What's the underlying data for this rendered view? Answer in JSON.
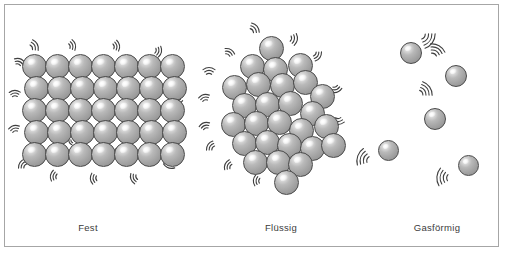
{
  "figure": {
    "width": 507,
    "height": 255,
    "background_color": "#ffffff",
    "frame_color": "#a6a6a6",
    "sphere_fill_color": "#a8a8a8",
    "sphere_outline_color": "#4a4a4a",
    "sphere_highlight_color": "#ffffff",
    "motion_line_color": "#3f3f3f",
    "caption_color": "#3b3b3b"
  },
  "panels": [
    {
      "id": "solid",
      "caption": "Fest",
      "caption_x": 88,
      "caption_y": 222,
      "arrangement": "regular-lattice",
      "rows": 5,
      "columns": 7,
      "particle_count": 35,
      "sphere_diameter": 25,
      "origin_x": 22,
      "origin_y": 54,
      "step_x": 23,
      "step_y": 22,
      "row_offsets": [
        0,
        1.5,
        0,
        1.5,
        0
      ],
      "motion_marks": [
        {
          "x": 28,
          "y": 49,
          "rot": -28,
          "arcs": 3,
          "size": 13
        },
        {
          "x": 66,
          "y": 47,
          "rot": -15,
          "arcs": 3,
          "size": 12
        },
        {
          "x": 110,
          "y": 47,
          "rot": -10,
          "arcs": 3,
          "size": 12
        },
        {
          "x": 152,
          "y": 50,
          "rot": 12,
          "arcs": 3,
          "size": 12
        },
        {
          "x": 172,
          "y": 63,
          "rot": 60,
          "arcs": 3,
          "size": 12
        },
        {
          "x": 175,
          "y": 95,
          "rot": 72,
          "arcs": 3,
          "size": 12
        },
        {
          "x": 176,
          "y": 130,
          "rot": 85,
          "arcs": 3,
          "size": 13
        },
        {
          "x": 172,
          "y": 158,
          "rot": 110,
          "arcs": 3,
          "size": 13
        },
        {
          "x": 140,
          "y": 176,
          "rot": 160,
          "arcs": 3,
          "size": 12
        },
        {
          "x": 100,
          "y": 178,
          "rot": 175,
          "arcs": 3,
          "size": 12
        },
        {
          "x": 60,
          "y": 177,
          "rot": 190,
          "arcs": 3,
          "size": 12
        },
        {
          "x": 28,
          "y": 168,
          "rot": 215,
          "arcs": 3,
          "size": 12
        },
        {
          "x": 16,
          "y": 135,
          "rot": 255,
          "arcs": 3,
          "size": 12
        },
        {
          "x": 15,
          "y": 100,
          "rot": 268,
          "arcs": 3,
          "size": 12
        },
        {
          "x": 17,
          "y": 68,
          "rot": 290,
          "arcs": 3,
          "size": 12
        },
        {
          "x": 52,
          "y": 92,
          "rot": 40,
          "arcs": 2,
          "size": 9
        },
        {
          "x": 96,
          "y": 112,
          "rot": -40,
          "arcs": 2,
          "size": 9
        },
        {
          "x": 128,
          "y": 90,
          "rot": 20,
          "arcs": 2,
          "size": 9
        },
        {
          "x": 74,
          "y": 140,
          "rot": 150,
          "arcs": 2,
          "size": 9
        },
        {
          "x": 120,
          "y": 152,
          "rot": 195,
          "arcs": 2,
          "size": 9
        }
      ]
    },
    {
      "id": "liquid",
      "caption": "Flüssig",
      "caption_x": 281,
      "caption_y": 222,
      "arrangement": "close-packed-irregular-cluster",
      "particle_count": 27,
      "sphere_diameter": 25,
      "spheres": [
        {
          "x": 259,
          "y": 36
        },
        {
          "x": 288,
          "y": 53
        },
        {
          "x": 240,
          "y": 54
        },
        {
          "x": 263,
          "y": 57
        },
        {
          "x": 222,
          "y": 75
        },
        {
          "x": 246,
          "y": 72
        },
        {
          "x": 270,
          "y": 73
        },
        {
          "x": 293,
          "y": 70
        },
        {
          "x": 310,
          "y": 84
        },
        {
          "x": 232,
          "y": 93
        },
        {
          "x": 255,
          "y": 92
        },
        {
          "x": 278,
          "y": 91
        },
        {
          "x": 300,
          "y": 101
        },
        {
          "x": 221,
          "y": 112
        },
        {
          "x": 244,
          "y": 111
        },
        {
          "x": 267,
          "y": 110
        },
        {
          "x": 289,
          "y": 118
        },
        {
          "x": 314,
          "y": 114
        },
        {
          "x": 232,
          "y": 131
        },
        {
          "x": 255,
          "y": 130
        },
        {
          "x": 277,
          "y": 133
        },
        {
          "x": 300,
          "y": 136
        },
        {
          "x": 321,
          "y": 133
        },
        {
          "x": 243,
          "y": 150
        },
        {
          "x": 266,
          "y": 150
        },
        {
          "x": 288,
          "y": 152
        },
        {
          "x": 274,
          "y": 170
        }
      ],
      "motion_marks": [
        {
          "x": 249,
          "y": 33,
          "rot": -40,
          "arcs": 3,
          "size": 13
        },
        {
          "x": 287,
          "y": 38,
          "rot": 10,
          "arcs": 3,
          "size": 13
        },
        {
          "x": 312,
          "y": 52,
          "rot": 35,
          "arcs": 3,
          "size": 12
        },
        {
          "x": 226,
          "y": 58,
          "rot": -60,
          "arcs": 3,
          "size": 12
        },
        {
          "x": 209,
          "y": 78,
          "rot": -90,
          "arcs": 3,
          "size": 13
        },
        {
          "x": 334,
          "y": 83,
          "rot": 70,
          "arcs": 3,
          "size": 12
        },
        {
          "x": 206,
          "y": 104,
          "rot": 255,
          "arcs": 3,
          "size": 12
        },
        {
          "x": 338,
          "y": 114,
          "rot": 88,
          "arcs": 3,
          "size": 13
        },
        {
          "x": 207,
          "y": 132,
          "rot": 250,
          "arcs": 3,
          "size": 12
        },
        {
          "x": 340,
          "y": 136,
          "rot": 105,
          "arcs": 3,
          "size": 12
        },
        {
          "x": 216,
          "y": 150,
          "rot": 215,
          "arcs": 3,
          "size": 12
        },
        {
          "x": 300,
          "y": 168,
          "rot": 150,
          "arcs": 3,
          "size": 12
        },
        {
          "x": 263,
          "y": 181,
          "rot": 185,
          "arcs": 3,
          "size": 12
        },
        {
          "x": 234,
          "y": 168,
          "rot": 205,
          "arcs": 3,
          "size": 12
        },
        {
          "x": 252,
          "y": 66,
          "rot": -20,
          "arcs": 2,
          "size": 9
        },
        {
          "x": 288,
          "y": 102,
          "rot": 45,
          "arcs": 2,
          "size": 9
        },
        {
          "x": 238,
          "y": 122,
          "rot": 160,
          "arcs": 2,
          "size": 9
        }
      ]
    },
    {
      "id": "gas",
      "caption": "Gasförmig",
      "caption_x": 437,
      "caption_y": 222,
      "arrangement": "dispersed-free",
      "particle_count": 5,
      "sphere_diameter": 22,
      "spheres": [
        {
          "x": 400,
          "y": 42,
          "d": 22
        },
        {
          "x": 445,
          "y": 65,
          "d": 22
        },
        {
          "x": 424,
          "y": 108,
          "d": 22
        },
        {
          "x": 378,
          "y": 140,
          "d": 21
        },
        {
          "x": 458,
          "y": 155,
          "d": 21
        }
      ],
      "motion_marks": [
        {
          "x": 420,
          "y": 34,
          "rot": 35,
          "arcs": 4,
          "size": 15
        },
        {
          "x": 432,
          "y": 58,
          "rot": -60,
          "arcs": 4,
          "size": 14
        },
        {
          "x": 418,
          "y": 95,
          "rot": -35,
          "arcs": 4,
          "size": 14
        },
        {
          "x": 372,
          "y": 161,
          "rot": 200,
          "arcs": 4,
          "size": 15
        },
        {
          "x": 452,
          "y": 178,
          "rot": 185,
          "arcs": 4,
          "size": 15
        }
      ]
    }
  ]
}
